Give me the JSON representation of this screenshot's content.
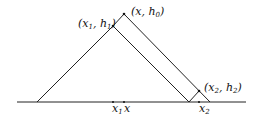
{
  "diagram": {
    "labels": {
      "apex": {
        "var": "x",
        "sep": ", ",
        "h": "h",
        "h_sub": "0"
      },
      "p1": {
        "x": "x",
        "x_sub": "1",
        "sep": ", ",
        "h": "h",
        "h_sub": "1"
      },
      "p2": {
        "x": "x",
        "x_sub": "2",
        "sep": ", ",
        "h": "h",
        "h_sub": "2"
      },
      "axis_x1": {
        "x": "x",
        "x_sub": "1"
      },
      "axis_x": "x",
      "axis_x2": {
        "x": "x",
        "x_sub": "2"
      }
    },
    "stroke_color": "#222222"
  }
}
